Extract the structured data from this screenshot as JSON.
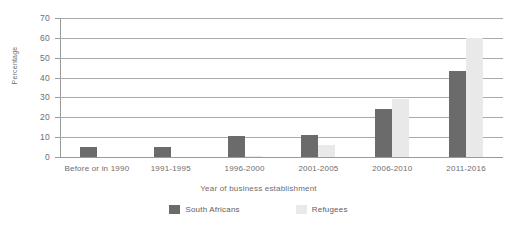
{
  "chart_data": {
    "type": "bar",
    "title": "",
    "subtitle": "",
    "xlabel": "Year of business establishment",
    "ylabel": "Percentage",
    "categories": [
      "Before or in 1990",
      "1991-1995",
      "1996-2000",
      "2001-2005",
      "2006-2010",
      "2011-2016"
    ],
    "series": [
      {
        "name": "South Africans",
        "color": "#6b6b6b",
        "values": [
          5,
          5,
          10.5,
          11,
          24,
          43.5
        ]
      },
      {
        "name": "Refugees",
        "color": "#e9e9e9",
        "values": [
          0,
          0,
          0.5,
          6,
          29,
          60
        ]
      }
    ],
    "ylim": [
      0,
      70
    ],
    "yticks": [
      0,
      10,
      20,
      30,
      40,
      50,
      60,
      70
    ],
    "ytick_labels": [
      "0",
      "10",
      "20",
      "30",
      "40",
      "50",
      "60",
      "70"
    ],
    "grid": "horizontal",
    "legend_position": "bottom",
    "axis_color": "#9a9a9a",
    "gridline_color": "#aaaaaa",
    "text_color": "#6d6d6d",
    "background": "#ffffff"
  }
}
